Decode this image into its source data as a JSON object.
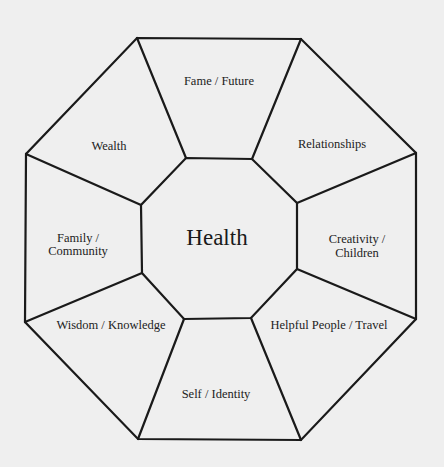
{
  "diagram": {
    "type": "bagua-octagon",
    "background_color": "#efefef",
    "line_color": "#1a1a1a",
    "center": {
      "label": "Health",
      "x": 217,
      "y": 237
    },
    "sectors": [
      {
        "id": "fame",
        "lines": [
          "Fame / Future"
        ],
        "x": 219,
        "y": 81
      },
      {
        "id": "relationships",
        "lines": [
          "Relationships"
        ],
        "x": 332,
        "y": 144
      },
      {
        "id": "creativity",
        "lines": [
          "Creativity /",
          "Children"
        ],
        "x": 357,
        "y": 239
      },
      {
        "id": "helpful",
        "lines": [
          "Helpful People / Travel"
        ],
        "x": 329,
        "y": 325
      },
      {
        "id": "self",
        "lines": [
          "Self / Identity"
        ],
        "x": 216,
        "y": 394
      },
      {
        "id": "wisdom",
        "lines": [
          "Wisdom / Knowledge"
        ],
        "x": 111,
        "y": 325
      },
      {
        "id": "family",
        "lines": [
          "Family /",
          "Community"
        ],
        "x": 78,
        "y": 238
      },
      {
        "id": "wealth",
        "lines": [
          "Wealth"
        ],
        "x": 109,
        "y": 146
      }
    ]
  }
}
